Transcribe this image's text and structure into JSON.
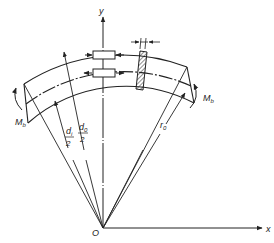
{
  "diagram": {
    "type": "curved beam in pure bending",
    "labels": {
      "y_axis": "y",
      "x_axis": "x",
      "origin": "O",
      "moment_left": "M",
      "moment_left_sub": "b",
      "moment_right": "M",
      "moment_right_sub": "b",
      "inner_dia_num": "d",
      "inner_dia_sub": "i",
      "inner_dia_den": "2",
      "outer_dia_num": "d",
      "outer_dia_sub": "0",
      "outer_dia_den": "2",
      "neutral_radius": "r",
      "neutral_radius_sub": "0",
      "element_width_mark": "//"
    },
    "colors": {
      "stroke": "#222222",
      "background": "#ffffff"
    }
  }
}
